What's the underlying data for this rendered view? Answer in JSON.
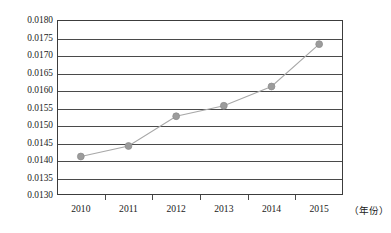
{
  "chart_data": {
    "type": "line",
    "title": "",
    "subtitle": "",
    "xlabel": "（年份）",
    "ylabel": "",
    "categories": [
      "2010",
      "2011",
      "2012",
      "2013",
      "2014",
      "2015"
    ],
    "x": [
      2010,
      2011,
      2012,
      2013,
      2014,
      2015
    ],
    "values": [
      0.0141,
      0.0144,
      0.01525,
      0.01555,
      0.0161,
      0.01731
    ],
    "series": [
      {
        "name": "",
        "values": [
          0.0141,
          0.0144,
          0.01525,
          0.01555,
          0.0161,
          0.01731
        ]
      }
    ],
    "ylim": [
      0.013,
      0.018
    ],
    "ytick_step": 0.0005,
    "ytick_labels": [
      "0.0180",
      "0.0175",
      "0.0170",
      "0.0165",
      "0.0160",
      "0.0155",
      "0.0150",
      "0.0145",
      "0.0140",
      "0.0135",
      "0.0130"
    ],
    "ytick_values": [
      0.018,
      0.0175,
      0.017,
      0.0165,
      0.016,
      0.0155,
      0.015,
      0.0145,
      0.014,
      0.0135,
      0.013
    ],
    "grid": true,
    "grid_axis": "y",
    "legend": false,
    "legend_position": "none",
    "marker": "circle",
    "marker_color": "#9c9c9c",
    "line_color": "#a8a8a8",
    "axis_color": "#3c3c3c",
    "grid_color": "#4a4a4a",
    "background": "#ffffff",
    "annotations": []
  }
}
